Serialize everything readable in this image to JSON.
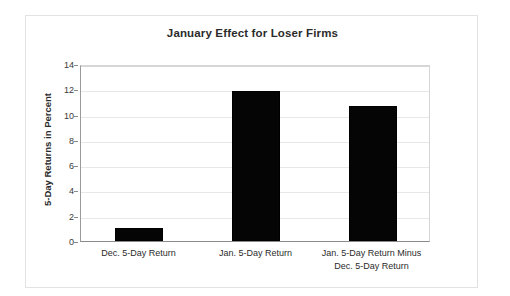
{
  "chart_data": {
    "type": "bar",
    "title": "January Effect for Loser Firms",
    "xlabel": "",
    "ylabel": "5-Day Returns in Percent",
    "categories": [
      "Dec. 5-Day Return",
      "Jan. 5-Day Return",
      "Jan. 5-Day Return Minus\nDec. 5-Day Return"
    ],
    "values": [
      1.0,
      11.9,
      10.7
    ],
    "ylim": [
      0,
      14
    ],
    "ytick_labels": [
      "14",
      "12",
      "10",
      "8",
      "6",
      "4",
      "2",
      "0"
    ],
    "ytick_values": [
      14,
      12,
      10,
      8,
      6,
      4,
      2,
      0
    ],
    "ytick_step": 2,
    "grid": true,
    "legend": false,
    "bar_color": "#050505",
    "gridline_color": "#e8e8e8",
    "axis_color": "#8a8a8a",
    "frame_color": "#e2e2e2",
    "text_color": "#2b2b2b",
    "background": "#ffffff"
  }
}
